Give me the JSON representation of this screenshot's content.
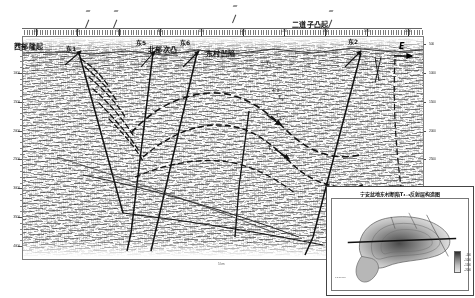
{
  "figure": {
    "type": "seismic-interpretation-profile",
    "direction_label": "E",
    "direction_name": "east-arrow"
  },
  "structural_units": [
    {
      "name": "western-uplift",
      "label": "西部隆起",
      "x": 14,
      "y": 41
    },
    {
      "name": "northern-sub-bulge",
      "label": "北部次凸",
      "x": 150,
      "y": 46
    },
    {
      "name": "dongcun-sag",
      "label": "东村凹陷",
      "x": 210,
      "y": 50
    },
    {
      "name": "erdaozi-bulge",
      "label": "二道子凸起",
      "x": 296,
      "y": 22
    }
  ],
  "wells": [
    {
      "name": "well-dong-1",
      "label": "东1",
      "x": 70,
      "y": 47,
      "top_x": 78,
      "bot_x": 122,
      "bot_y": 196
    },
    {
      "name": "well-dong-5",
      "label": "东5",
      "x": 140,
      "y": 40,
      "top_x": 152,
      "bot_x": 130,
      "bot_y": 214
    },
    {
      "name": "well-dong-6",
      "label": "东6",
      "x": 183,
      "y": 40,
      "top_x": 196,
      "bot_x": 150,
      "bot_y": 214
    },
    {
      "name": "well-dong-2",
      "label": "东2",
      "x": 352,
      "y": 39,
      "top_x": 360,
      "bot_x": 304,
      "bot_y": 214
    }
  ],
  "horizons": [
    {
      "name": "horizon-t4-1",
      "label": "T",
      "sub": "4-1",
      "x": 272,
      "y": 62
    },
    {
      "name": "horizon-t4-2",
      "label": "T",
      "sub": "4-2",
      "x": 282,
      "y": 115
    },
    {
      "name": "horizon-t4",
      "label": "T",
      "sub": "4",
      "x": 274,
      "y": 148
    },
    {
      "name": "horizon-t3",
      "label": "T",
      "sub": "3",
      "x": 282,
      "y": 96
    }
  ],
  "annotations": [
    {
      "name": "depth-marker-4-8",
      "label": "4.8",
      "x": 276,
      "y": 91
    }
  ],
  "axis_left": {
    "name": "two-way-time-axis-left",
    "unit": "ms",
    "ticks": [
      "500",
      "1000",
      "1500",
      "2000",
      "2500",
      "3000",
      "3500",
      "4000"
    ]
  },
  "axis_right": {
    "name": "two-way-time-axis-right",
    "unit": "ms",
    "ticks": [
      "500",
      "1000",
      "1500",
      "2000",
      "2500",
      "3000",
      "3500",
      "4000"
    ]
  },
  "cdp_ruler": {
    "name": "cdp-shotpoint-ruler",
    "labels": [
      "200",
      "400",
      "600",
      "800",
      "1000",
      "1200",
      "1400",
      "1600",
      "1800",
      "2000"
    ]
  },
  "scale_note": {
    "name": "horizontal-scale-note",
    "label": "5 km"
  },
  "inset_map": {
    "name": "inset-structure-map",
    "title": "宁安盆地东村断陷T₄₋₃反射层构造图",
    "legend_values": [
      "-500",
      "-1000",
      "-1500",
      "-2000"
    ],
    "scale": "0    5   10 km"
  }
}
